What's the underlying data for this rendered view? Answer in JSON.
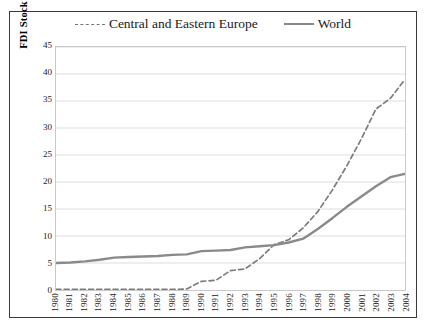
{
  "chart_data": {
    "type": "line",
    "title": "",
    "xlabel": "",
    "ylabel": "FDI Stock as percent GDP",
    "ylim": [
      0,
      45
    ],
    "yticks": [
      0,
      5,
      10,
      15,
      20,
      25,
      30,
      35,
      40,
      45
    ],
    "grid": true,
    "legend_position": "top",
    "x": [
      1980,
      1981,
      1982,
      1983,
      1984,
      1985,
      1986,
      1987,
      1988,
      1989,
      1990,
      1991,
      1992,
      1993,
      1994,
      1995,
      1996,
      1997,
      1998,
      1999,
      2000,
      2001,
      2002,
      2003,
      2004
    ],
    "categories": [
      "1980",
      "1981",
      "1982",
      "1983",
      "1984",
      "1985",
      "1986",
      "1987",
      "1988",
      "1989",
      "1990",
      "1991",
      "1992",
      "1993",
      "1994",
      "1995",
      "1996",
      "1997",
      "1998",
      "1999",
      "2000",
      "2001",
      "2002",
      "2003",
      "2004"
    ],
    "series": [
      {
        "name": "Central and Eastern Europe",
        "style": "dashed",
        "color": "#7c7c7c",
        "values": [
          0.1,
          0.1,
          0.1,
          0.1,
          0.1,
          0.1,
          0.1,
          0.1,
          0.1,
          0.2,
          1.6,
          1.8,
          3.6,
          3.9,
          5.8,
          8.4,
          9.3,
          11.5,
          14.5,
          18.5,
          23.0,
          28.0,
          33.5,
          35.5,
          39.0
        ]
      },
      {
        "name": "World",
        "style": "solid",
        "color": "#8a8a8a",
        "values": [
          5.0,
          5.1,
          5.3,
          5.6,
          6.0,
          6.1,
          6.2,
          6.3,
          6.5,
          6.6,
          7.2,
          7.3,
          7.4,
          7.9,
          8.1,
          8.3,
          8.8,
          9.5,
          11.3,
          13.3,
          15.4,
          17.3,
          19.2,
          20.9,
          21.5
        ]
      }
    ]
  },
  "legend": {
    "entries": [
      {
        "label": "Central and Eastern Europe",
        "key": "dashed-line-key"
      },
      {
        "label": "World",
        "key": "solid-line-key"
      }
    ]
  }
}
